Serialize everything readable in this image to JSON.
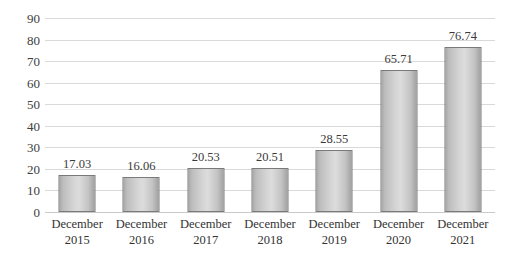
{
  "chart_data": {
    "type": "bar",
    "title": "",
    "subtitle": "",
    "xlabel": "",
    "ylabel": "",
    "categories": [
      "December 2015",
      "December 2016",
      "December 2017",
      "December 2018",
      "December 2019",
      "December 2020",
      "December 2021"
    ],
    "category_lines": [
      [
        "December",
        "2015"
      ],
      [
        "December",
        "2016"
      ],
      [
        "December",
        "2017"
      ],
      [
        "December",
        "2018"
      ],
      [
        "December",
        "2019"
      ],
      [
        "December",
        "2020"
      ],
      [
        "December",
        "2021"
      ]
    ],
    "values": [
      17.03,
      16.06,
      20.53,
      20.51,
      28.55,
      65.71,
      76.74
    ],
    "value_labels": [
      "17.03",
      "16.06",
      "20.53",
      "20.51",
      "28.55",
      "65.71",
      "76.74"
    ],
    "ylim": [
      0,
      90
    ],
    "ytick_step": 10,
    "ytick_labels": [
      "90",
      "80",
      "70",
      "60",
      "50",
      "40",
      "30",
      "20",
      "10",
      "0"
    ],
    "ytick_values": [
      90,
      80,
      70,
      60,
      50,
      40,
      30,
      20,
      10,
      0
    ],
    "grid": true,
    "grid_axis": "y",
    "legend": false,
    "legend_position": "none",
    "data_labels": true,
    "colors": {
      "bar_fill_light": "#dcdcdc",
      "bar_fill_mid": "#c4c4c4",
      "bar_fill_dark": "#a2a2a2",
      "bar_border": "#7a7a7a",
      "gridline": "#d9d9d9",
      "baseline": "#c9c9c9",
      "text": "#3a3a3a",
      "background": "#ffffff"
    }
  }
}
